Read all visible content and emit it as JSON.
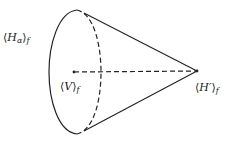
{
  "diagram": {
    "type": "cone",
    "labels": {
      "base": {
        "open": "⟨",
        "main": "H",
        "sub_main": "α",
        "close": "⟩",
        "subscript": "f"
      },
      "vertex": {
        "open": "⟨",
        "main": "V",
        "close": "⟩",
        "subscript": "f"
      },
      "apex": {
        "open": "⟨",
        "main": "H′",
        "close": "⟩",
        "subscript": "f"
      }
    },
    "colors": {
      "stroke": "#222222",
      "background": "#ffffff"
    }
  }
}
